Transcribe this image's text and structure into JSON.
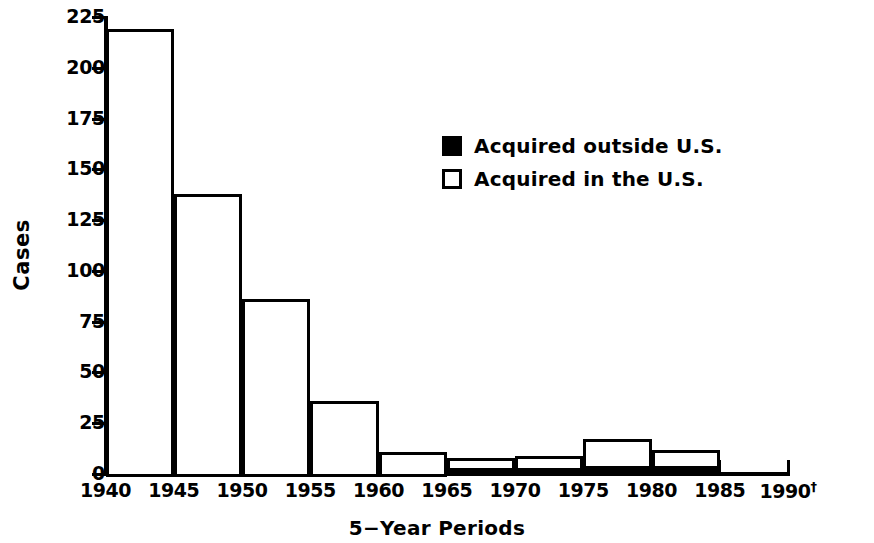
{
  "chart_data": {
    "type": "bar",
    "title": "",
    "xlabel": "5−Year Periods",
    "ylabel": "Cases",
    "ylim": [
      0,
      225
    ],
    "ytick_values": [
      0,
      25,
      50,
      75,
      100,
      125,
      150,
      175,
      200,
      225
    ],
    "ytick_labels": [
      "0",
      "25",
      "50",
      "75",
      "100",
      "125",
      "150",
      "175",
      "200",
      "225"
    ],
    "xtick_labels": [
      "1940",
      "1945",
      "1950",
      "1955",
      "1960",
      "1965",
      "1970",
      "1975",
      "1980",
      "1985",
      "1990"
    ],
    "xtick_last_marker": "†",
    "grid": false,
    "legend_position": "upper-right-inside",
    "categories": [
      "1940-1945",
      "1945-1950",
      "1950-1955",
      "1955-1960",
      "1960-1965",
      "1965-1970",
      "1970-1975",
      "1975-1980",
      "1980-1985",
      "1985-1990"
    ],
    "series": [
      {
        "name": "Acquired outside U.S.",
        "color": "#000000",
        "values": [
          0,
          0,
          0,
          0,
          0,
          3,
          3,
          4,
          4,
          0
        ]
      },
      {
        "name": "Acquired in the U.S.",
        "color": "#ffffff",
        "values": [
          219,
          138,
          86,
          36,
          11,
          5,
          6,
          13,
          8,
          0
        ]
      }
    ],
    "totals": [
      219,
      138,
      86,
      36,
      11,
      8,
      9,
      17,
      12,
      0
    ]
  },
  "legend": {
    "items": [
      {
        "label": "Acquired outside U.S.",
        "swatch": "filled"
      },
      {
        "label": "Acquired in the U.S.",
        "swatch": "open"
      }
    ]
  },
  "axes": {
    "y_title": "Cases",
    "x_title": "5−Year Periods"
  },
  "colors": {
    "ink": "#000000",
    "background": "#ffffff"
  }
}
